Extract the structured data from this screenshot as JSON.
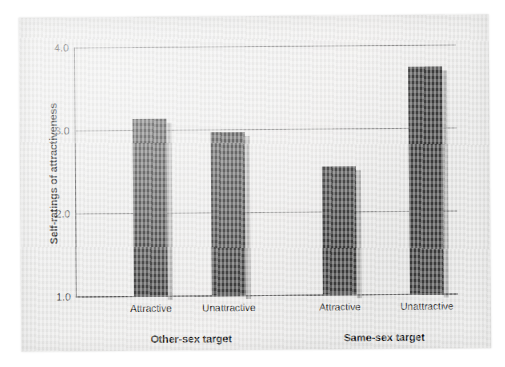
{
  "chart_data": {
    "type": "bar",
    "title": "",
    "xlabel": "",
    "ylabel": "Self-ratings of attractiveness",
    "ylim": [
      1.0,
      4.0
    ],
    "ytick_labels": [
      "4.0",
      "3.0",
      "2.0",
      "1.0"
    ],
    "ytick_values": [
      4.0,
      3.0,
      2.0,
      1.0
    ],
    "grid": true,
    "legend": "none",
    "categories": [
      "Attractive",
      "Unattractive",
      "Attractive",
      "Unattractive"
    ],
    "values": [
      3.12,
      2.96,
      2.54,
      3.72
    ],
    "groups": [
      {
        "label": "Other-sex target",
        "categories": [
          "Attractive",
          "Unattractive"
        ],
        "values": [
          3.12,
          2.96
        ]
      },
      {
        "label": "Same-sex target",
        "categories": [
          "Attractive",
          "Unattractive"
        ],
        "values": [
          2.54,
          3.72
        ]
      }
    ],
    "bar_color": "#3d3d3d",
    "background_color": "#ececeb"
  },
  "bars": [
    {
      "category": "Attractive",
      "value": 3.12,
      "group": "Other-sex target"
    },
    {
      "category": "Unattractive",
      "value": 2.96,
      "group": "Other-sex target"
    },
    {
      "category": "Attractive",
      "value": 2.54,
      "group": "Same-sex target"
    },
    {
      "category": "Unattractive",
      "value": 3.72,
      "group": "Same-sex target"
    }
  ],
  "axis": {
    "y_label": "Self-ratings of attractiveness",
    "y_ticks": [
      "4.0",
      "3.0",
      "2.0",
      "1.0"
    ]
  },
  "group_labels": [
    "Other-sex target",
    "Same-sex target"
  ]
}
